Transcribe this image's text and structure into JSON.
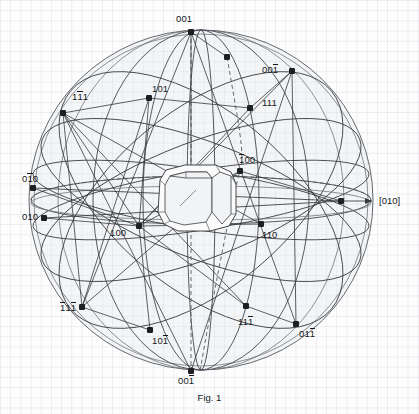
{
  "figure": {
    "caption": "Fig. 1",
    "type": "crystallographic-stereographic-projection",
    "background": "faint-graph-paper-grid",
    "grid_color": "#e1e4e8",
    "line_color": "#35383d",
    "sphere_fill": "#e1e4e8"
  },
  "chart_data": {
    "type": "scatter",
    "title": "Fig. 1",
    "subtitle": "",
    "xlabel": "",
    "ylabel": "",
    "sphere": {
      "cx": 201,
      "cy": 200,
      "rx": 172,
      "ry": 170
    },
    "reference_axis": {
      "label": "[010]",
      "direction": "right",
      "x": 376,
      "y": 201
    },
    "grid": true,
    "legend": "none",
    "poles": [
      {
        "label": "001",
        "bar": [],
        "x": 191,
        "y": 32,
        "lx": 176,
        "ly": 14
      },
      {
        "label": "001",
        "bar": [
          2
        ],
        "x": 292,
        "y": 71,
        "lx": 262,
        "ly": 65
      },
      {
        "label": "111",
        "bar": [
          1
        ],
        "x": 63,
        "y": 113,
        "lx": 72,
        "ly": 92
      },
      {
        "label": "101",
        "bar": [],
        "x": 149,
        "y": 98,
        "lx": 152,
        "ly": 84
      },
      {
        "label": "111",
        "bar": [],
        "x": 250,
        "y": 108,
        "lx": 262,
        "ly": 98
      },
      {
        "label": "100",
        "bar": [
          0
        ],
        "x": 240,
        "y": 171,
        "lx": 239,
        "ly": 155
      },
      {
        "label": "010",
        "bar": [
          1
        ],
        "x": 33,
        "y": 188,
        "lx": 22,
        "ly": 174
      },
      {
        "label": "010",
        "bar": [],
        "x": 44,
        "y": 218,
        "lx": 22,
        "ly": 212
      },
      {
        "label": "100",
        "bar": [],
        "x": 139,
        "y": 226,
        "lx": 110,
        "ly": 228
      },
      {
        "label": "110",
        "bar": [],
        "x": 261,
        "y": 224,
        "lx": 262,
        "ly": 230
      },
      {
        "label": "111",
        "bar": [
          0,
          2
        ],
        "x": 82,
        "y": 307,
        "lx": 60,
        "ly": 303
      },
      {
        "label": "101",
        "bar": [
          2
        ],
        "x": 150,
        "y": 330,
        "lx": 152,
        "ly": 336
      },
      {
        "label": "111",
        "bar": [
          2
        ],
        "x": 246,
        "y": 306,
        "lx": 238,
        "ly": 317
      },
      {
        "label": "011",
        "bar": [
          2
        ],
        "x": 296,
        "y": 324,
        "lx": 299,
        "ly": 329
      },
      {
        "label": "001",
        "bar": [
          2
        ],
        "x": 191,
        "y": 371,
        "lx": 178,
        "ly": 376
      }
    ],
    "unlabeled_markers": [
      {
        "x": 227,
        "y": 57
      },
      {
        "x": 341,
        "y": 201
      }
    ]
  },
  "labels": {
    "top_001": "001",
    "upper_right_001bar": "001",
    "upper_left_1bar11": "111",
    "upper_101": "101",
    "upper_right_111": "111",
    "mid_1bar00": "100",
    "left_01bar0": "010",
    "left_010": "010",
    "mid_100": "100",
    "mid_110": "110",
    "lower_left_1bar11bar": "111",
    "lower_101bar": "101",
    "lower_111bar": "111",
    "lower_right_011bar": "011",
    "bottom_001bar": "001",
    "axis_010": "[010]"
  }
}
